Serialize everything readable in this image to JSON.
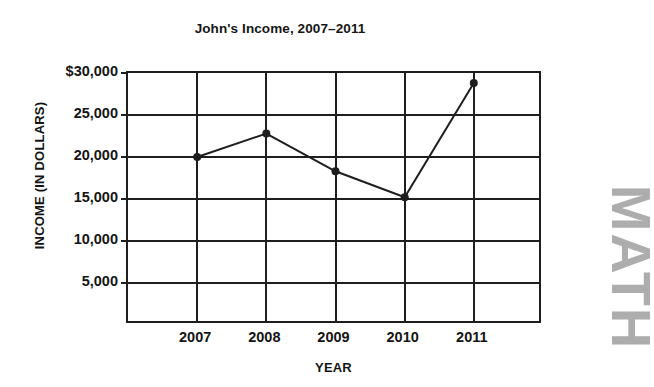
{
  "chart_data": {
    "type": "line",
    "title": "John's Income, 2007–2011",
    "xlabel": "YEAR",
    "ylabel": "INCOME (IN DOLLARS)",
    "categories": [
      "2007",
      "2008",
      "2009",
      "2010",
      "2011"
    ],
    "values": [
      20000,
      22800,
      18300,
      15200,
      28800
    ],
    "series": [
      {
        "name": "John's Income",
        "values": [
          20000,
          22800,
          18300,
          15200,
          28800
        ]
      }
    ],
    "ylim": [
      0,
      30000
    ],
    "ytick_labels": [
      "$30,000",
      "25,000",
      "20,000",
      "15,000",
      "10,000",
      "5,000"
    ],
    "ytick_values": [
      30000,
      25000,
      20000,
      15000,
      10000,
      5000
    ],
    "xtick_labels": [
      "2007",
      "2008",
      "2009",
      "2010",
      "2011"
    ],
    "grid": true,
    "legend": "none",
    "marker": "filled-circle",
    "line_color": "#1e1e1e",
    "grid_color": "#1e1e1e",
    "background_color": "#ffffff"
  },
  "watermark": {
    "text": "MATH",
    "color": "#adadad"
  }
}
